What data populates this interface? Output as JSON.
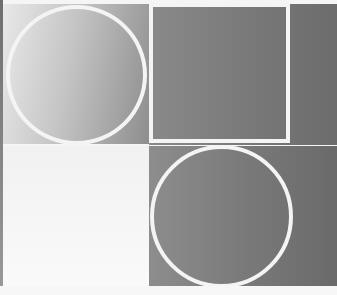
{
  "artwork": {
    "description": "Abstract grayscale composition: 2x2 grid of gradient panels with white circle and square outlines",
    "layout": "2x2 grid",
    "panels": [
      {
        "position": "top-left",
        "fill": "light-to-mid gray gradient",
        "outline_shape": "circle"
      },
      {
        "position": "top-right",
        "fill": "mid gray",
        "outline_shape": "square"
      },
      {
        "position": "bottom-left",
        "fill": "near-white",
        "outline_shape": "none"
      },
      {
        "position": "bottom-right",
        "fill": "mid-to-dark gray gradient",
        "outline_shape": "circle"
      }
    ],
    "colors": {
      "outline": "#f4f4f4",
      "light_gray": "#e8e8e8",
      "mid_gray": "#8a8a8a",
      "dark_gray": "#6a6a6a",
      "background": "#f5f5f5"
    }
  }
}
